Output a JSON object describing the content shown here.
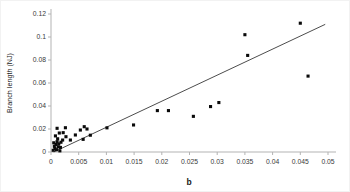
{
  "chart_data": {
    "type": "scatter",
    "title": "",
    "xlabel": "b",
    "ylabel": "Branch length (NJ)",
    "xlim": [
      0,
      0.05
    ],
    "ylim": [
      0,
      0.12
    ],
    "grid": false,
    "legend": false,
    "marker": "filled-black-square",
    "marker_color": "#0a0a0a",
    "axis_color": "#b3b3b3",
    "label_color": "#3a3a3a",
    "trendline_color": "#4d4d4d",
    "xticks": [
      0,
      0.005,
      0.01,
      0.015,
      0.02,
      0.025,
      0.03,
      0.035,
      0.04,
      0.045,
      0.05
    ],
    "xtick_labels": [
      "0",
      "0.005",
      "0.01",
      "0.015",
      "0.02",
      "0.025",
      "0.03",
      "0.035",
      "0.04",
      "0.045",
      "0.05"
    ],
    "yticks": [
      0,
      0.02,
      0.04,
      0.06,
      0.08,
      0.1,
      0.12
    ],
    "ytick_labels": [
      "0",
      "0.02",
      "0.04",
      "0.06",
      "0.08",
      "0.1",
      "0.12"
    ],
    "trendline": {
      "x1": 0.0005,
      "y1": 0.0,
      "x2": 0.0495,
      "y2": 0.111
    },
    "points": [
      [
        0.0004,
        0.0015
      ],
      [
        0.0007,
        0.003
      ],
      [
        0.001,
        0.002
      ],
      [
        0.0013,
        0.0045
      ],
      [
        0.0006,
        0.005
      ],
      [
        0.0009,
        0.0065
      ],
      [
        0.0014,
        0.007
      ],
      [
        0.0017,
        0.004
      ],
      [
        0.0011,
        0.009
      ],
      [
        0.0018,
        0.0085
      ],
      [
        0.0005,
        0.008
      ],
      [
        0.0016,
        0.001
      ],
      [
        0.0021,
        0.0104
      ],
      [
        0.0012,
        0.0115
      ],
      [
        0.0011,
        0.0206
      ],
      [
        0.0026,
        0.0211
      ],
      [
        0.0022,
        0.0168
      ],
      [
        0.0015,
        0.0165
      ],
      [
        0.0008,
        0.014
      ],
      [
        0.0027,
        0.0133
      ],
      [
        0.0035,
        0.0104
      ],
      [
        0.0044,
        0.0148
      ],
      [
        0.0053,
        0.0191
      ],
      [
        0.006,
        0.022
      ],
      [
        0.0058,
        0.011
      ],
      [
        0.0065,
        0.02
      ],
      [
        0.0071,
        0.0146
      ],
      [
        0.0101,
        0.021
      ],
      [
        0.0149,
        0.0235
      ],
      [
        0.0192,
        0.036
      ],
      [
        0.0212,
        0.036
      ],
      [
        0.0257,
        0.031
      ],
      [
        0.0288,
        0.0395
      ],
      [
        0.0303,
        0.043
      ],
      [
        0.035,
        0.102
      ],
      [
        0.0355,
        0.084
      ],
      [
        0.045,
        0.112
      ],
      [
        0.0464,
        0.066
      ]
    ]
  }
}
